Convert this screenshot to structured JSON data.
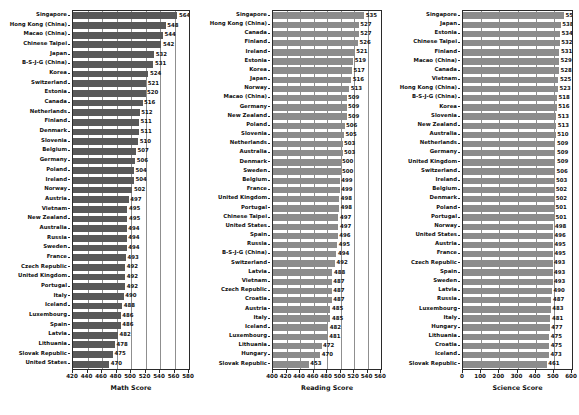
{
  "chart_data": [
    {
      "type": "bar",
      "orientation": "horizontal",
      "title": "",
      "xlabel": "Math Score",
      "ylabel": "",
      "xlim": [
        420,
        580
      ],
      "xticks": [
        420,
        440,
        460,
        480,
        500,
        520,
        540,
        560,
        580
      ],
      "grid": true,
      "bar_color": "#595959",
      "categories": [
        "Singapore",
        "Hong Kong (China)",
        "Macao (China)",
        "Chinese Taipei",
        "Japan",
        "B-S-J-G (China)",
        "Korea",
        "Switzerland",
        "Estonia",
        "Canada",
        "Netherlands",
        "Finland",
        "Denmark",
        "Slovenia",
        "Belgium",
        "Germany",
        "Poland",
        "Ireland",
        "Norway",
        "Austria",
        "Vietnam",
        "New Zealand",
        "Australia",
        "Russia",
        "Sweden",
        "France",
        "Czech Republic",
        "United Kingdom",
        "Portugal",
        "Italy",
        "Iceland",
        "Luxembourg",
        "Spain",
        "Latvia",
        "Lithuania",
        "Slovak Republic",
        "United States"
      ],
      "values": [
        564,
        548,
        544,
        542,
        532,
        531,
        524,
        521,
        520,
        516,
        512,
        511,
        511,
        510,
        507,
        506,
        504,
        504,
        502,
        497,
        495,
        495,
        494,
        494,
        494,
        493,
        492,
        492,
        492,
        490,
        488,
        486,
        486,
        482,
        478,
        475,
        470
      ]
    },
    {
      "type": "bar",
      "orientation": "horizontal",
      "title": "",
      "xlabel": "Reading Score",
      "ylabel": "",
      "xlim": [
        400,
        560
      ],
      "xticks": [
        400,
        420,
        440,
        460,
        480,
        500,
        520,
        540,
        560
      ],
      "grid": true,
      "bar_color": "#8c8c8c",
      "categories": [
        "Singapore",
        "Hong Kong (China)",
        "Canada",
        "Finland",
        "Ireland",
        "Estonia",
        "Korea",
        "Japan",
        "Norway",
        "Macao (China)",
        "Germany",
        "New Zealand",
        "Poland",
        "Slovenia",
        "Netherlands",
        "Australia",
        "Denmark",
        "Sweden",
        "Belgium",
        "France",
        "United Kingdom",
        "Portugal",
        "Chinese Taipei",
        "United States",
        "Spain",
        "Russia",
        "B-S-J-G (China)",
        "Switzerland",
        "Latvia",
        "Vietnam",
        "Czech Republic",
        "Croatia",
        "Austria",
        "Italy",
        "Iceland",
        "Luxembourg",
        "Lithuania",
        "Hungary",
        "Slovak Republic"
      ],
      "values": [
        535,
        527,
        527,
        526,
        521,
        519,
        517,
        516,
        513,
        509,
        509,
        509,
        506,
        505,
        503,
        503,
        500,
        500,
        499,
        499,
        498,
        498,
        497,
        497,
        496,
        495,
        494,
        492,
        488,
        487,
        487,
        487,
        485,
        485,
        482,
        481,
        472,
        470,
        453
      ]
    },
    {
      "type": "bar",
      "orientation": "horizontal",
      "title": "",
      "xlabel": "Science Score",
      "ylabel": "",
      "xlim": [
        0,
        600
      ],
      "xticks": [
        0,
        100,
        200,
        300,
        400,
        500,
        600
      ],
      "grid": true,
      "bar_color": "#8c8c8c",
      "categories": [
        "Singapore",
        "Japan",
        "Estonia",
        "Chinese Taipei",
        "Finland",
        "Macao (China)",
        "Canada",
        "Vietnam",
        "Hong Kong (China)",
        "B-S-J-G (China)",
        "Korea",
        "Slovenia",
        "New Zealand",
        "Australia",
        "Netherlands",
        "Germany",
        "United Kingdom",
        "Switzerland",
        "Ireland",
        "Belgium",
        "Denmark",
        "Poland",
        "Portugal",
        "Norway",
        "United States",
        "Austria",
        "France",
        "Czech Republic",
        "Spain",
        "Sweden",
        "Latvia",
        "Russia",
        "Luxembourg",
        "Italy",
        "Hungary",
        "Lithuania",
        "Croatia",
        "Iceland",
        "Slovak Republic"
      ],
      "values": [
        556,
        538,
        534,
        532,
        531,
        529,
        528,
        525,
        523,
        518,
        516,
        513,
        513,
        510,
        509,
        509,
        509,
        506,
        503,
        502,
        502,
        501,
        501,
        498,
        496,
        495,
        495,
        493,
        493,
        493,
        490,
        487,
        483,
        481,
        477,
        475,
        475,
        473,
        461
      ]
    }
  ]
}
